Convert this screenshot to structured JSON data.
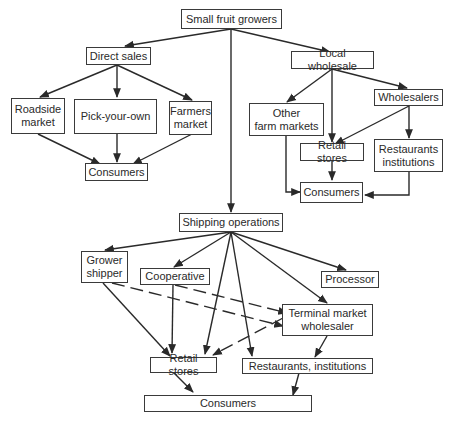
{
  "diagram": {
    "nodes": {
      "growers": "Small fruit growers",
      "direct_sales": "Direct sales",
      "roadside": "Roadside\nmarket",
      "pick_your_own": "Pick-your-own",
      "farmers_market": "Farmers\nmarket",
      "consumers_direct": "Consumers",
      "local_wholesale": "Local wholesale",
      "other_farm_markets": "Other\nfarm markets",
      "wholesalers": "Wholesalers",
      "retail_local": "Retail stores",
      "restaurants_local": "Restaurants\ninstitutions",
      "consumers_local": "Consumers",
      "shipping": "Shipping operations",
      "grower_shipper": "Grower\nshipper",
      "cooperative": "Cooperative",
      "processor": "Processor",
      "terminal": "Terminal market\nwholesaler",
      "retail_ship": "Retail stores",
      "restaurants_ship": "Restaurants, institutions",
      "consumers_ship": "Consumers"
    },
    "edges": [
      [
        "Small fruit growers",
        "Direct sales"
      ],
      [
        "Small fruit growers",
        "Local wholesale"
      ],
      [
        "Small fruit growers",
        "Shipping operations"
      ],
      [
        "Direct sales",
        "Roadside market"
      ],
      [
        "Direct sales",
        "Pick-your-own"
      ],
      [
        "Direct sales",
        "Farmers market"
      ],
      [
        "Roadside market",
        "Consumers"
      ],
      [
        "Pick-your-own",
        "Consumers"
      ],
      [
        "Farmers market",
        "Consumers"
      ],
      [
        "Local wholesale",
        "Other farm markets"
      ],
      [
        "Local wholesale",
        "Retail stores"
      ],
      [
        "Local wholesale",
        "Wholesalers"
      ],
      [
        "Wholesalers",
        "Retail stores"
      ],
      [
        "Wholesalers",
        "Restaurants institutions"
      ],
      [
        "Other farm markets",
        "Consumers"
      ],
      [
        "Retail stores",
        "Consumers"
      ],
      [
        "Restaurants institutions",
        "Consumers"
      ],
      [
        "Shipping operations",
        "Grower shipper"
      ],
      [
        "Shipping operations",
        "Cooperative"
      ],
      [
        "Shipping operations",
        "Retail stores"
      ],
      [
        "Shipping operations",
        "Restaurants, institutions"
      ],
      [
        "Shipping operations",
        "Terminal market wholesaler"
      ],
      [
        "Shipping operations",
        "Processor"
      ],
      [
        "Grower shipper",
        "Retail stores"
      ],
      [
        "Grower shipper",
        "Terminal market wholesaler",
        "dashed"
      ],
      [
        "Cooperative",
        "Retail stores"
      ],
      [
        "Cooperative",
        "Terminal market wholesaler",
        "dashed"
      ],
      [
        "Terminal market wholesaler",
        "Retail stores",
        "dashed"
      ],
      [
        "Terminal market wholesaler",
        "Restaurants, institutions"
      ],
      [
        "Retail stores",
        "Consumers"
      ],
      [
        "Restaurants, institutions",
        "Consumers"
      ]
    ]
  }
}
